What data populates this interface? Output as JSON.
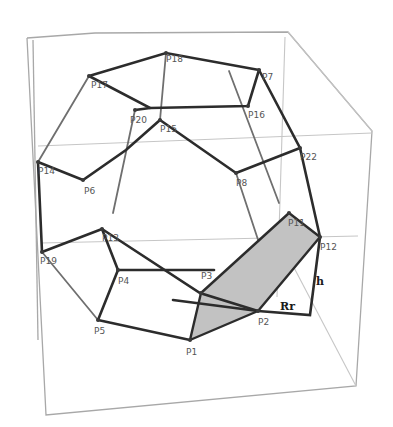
{
  "figure": {
    "vertex_labels": {
      "P1": "P1",
      "P2": "P2",
      "P3": "P3",
      "P4": "P4",
      "P5": "P5",
      "P6": "P6",
      "P7": "P7",
      "P8": "P8",
      "P11": "P11",
      "P12": "P12",
      "P13": "P13",
      "P14": "P14",
      "P15": "P15",
      "P16": "P16",
      "P17": "P17",
      "P18": "P18",
      "P19": "P19",
      "P20": "P20",
      "P21": "P21",
      "P22": "P22"
    },
    "annotations": {
      "rt_label": "Rr",
      "h_label": "h"
    },
    "colors": {
      "background": "#ffffff",
      "edge": "#2c2c2c",
      "box": "#a8a8a8",
      "shaded_face": "#c2c2c2"
    }
  }
}
